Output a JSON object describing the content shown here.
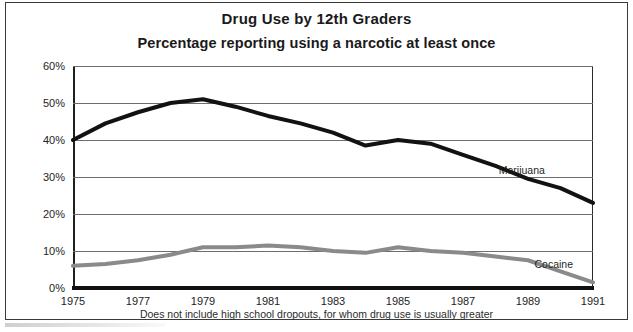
{
  "figure": {
    "title": "Drug Use by 12th Graders",
    "subtitle": "Percentage reporting using a narcotic at least once",
    "footnote": "Does not include high school dropouts, for whom drug use is usually greater"
  },
  "chart_data": {
    "type": "line",
    "title": "Drug Use by 12th Graders",
    "subtitle": "Percentage reporting using a narcotic at least once",
    "xlabel": "",
    "ylabel": "",
    "ylim": [
      0,
      60
    ],
    "xlim": [
      1975,
      1991
    ],
    "grid": true,
    "legend_position": "inline-right",
    "ytick_labels": [
      "0%",
      "10%",
      "20%",
      "30%",
      "40%",
      "50%",
      "60%"
    ],
    "ytick_values": [
      0,
      10,
      20,
      30,
      40,
      50,
      60
    ],
    "xtick_labels": [
      "1975",
      "1977",
      "1979",
      "1981",
      "1983",
      "1985",
      "1987",
      "1989",
      "1991"
    ],
    "xtick_values": [
      1975,
      1977,
      1979,
      1981,
      1983,
      1985,
      1987,
      1989,
      1991
    ],
    "x": [
      1975,
      1976,
      1977,
      1978,
      1979,
      1980,
      1981,
      1982,
      1983,
      1984,
      1985,
      1986,
      1987,
      1988,
      1989,
      1990,
      1991
    ],
    "series": [
      {
        "name": "Marijuana",
        "color": "#121212",
        "width": 4,
        "values": [
          40,
          44.5,
          47.5,
          50,
          51,
          49,
          46.5,
          44.5,
          42,
          38.5,
          40,
          39,
          36,
          33,
          29.5,
          27,
          23
        ]
      },
      {
        "name": "Cocaine",
        "color": "#8a8a8a",
        "width": 4,
        "values": [
          6,
          6.5,
          7.5,
          9,
          11,
          11,
          11.5,
          11,
          10,
          9.5,
          11,
          10,
          9.5,
          8.5,
          7.5,
          4.5,
          1.5
        ]
      }
    ],
    "annotations": [
      {
        "text": "Marijuana",
        "x": 1988.1,
        "y": 31.5
      },
      {
        "text": "Cocaine",
        "x": 1989.2,
        "y": 6.2
      }
    ]
  },
  "colors": {
    "marijuana": "#121212",
    "cocaine": "#8a8a8a",
    "grid": "#6d6d6d",
    "frame": "#3a3a3a",
    "text": "#1a1a1a"
  }
}
